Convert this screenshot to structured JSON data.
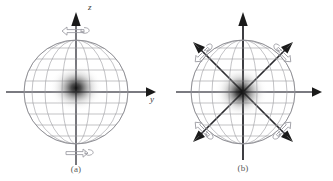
{
  "figure": {
    "background_color": "#ffffff",
    "width": 333,
    "height": 181
  },
  "colors": {
    "grid": "#9a9aa0",
    "outline": "#8a8a90",
    "axis_gray": "#7a7a80",
    "axis_black": "#1a1a1a",
    "blob": "#1a1a1a",
    "hollow_arrow_stroke": "#9a9aa0",
    "caption_text": "#5a5a5a",
    "label_text": "#3c3c3c"
  },
  "panels": [
    {
      "id": "a",
      "caption": "(a)",
      "center": {
        "x": 76,
        "y": 92
      },
      "radius": 52,
      "sphere": {
        "latitude_count": 9,
        "longitude_count": 7,
        "blob": {
          "cx": 76,
          "cy": 88,
          "rx": 27,
          "ry": 24,
          "label": "probability-density-blob"
        }
      },
      "axes": [
        {
          "name": "z-axis",
          "label": "z",
          "orientation": "vertical",
          "arrow": "solid",
          "color": "#1a1a1a"
        },
        {
          "name": "y-axis",
          "label": "y",
          "orientation": "horizontal",
          "arrow": "solid",
          "color": "#7a7a80"
        }
      ],
      "rotation_arrows": [
        {
          "name": "rotation-arrow-top",
          "position": "top",
          "direction": "right",
          "style": "hollow-curved"
        },
        {
          "name": "rotation-arrow-bottom",
          "position": "bottom",
          "direction": "left",
          "style": "hollow-curved"
        }
      ],
      "spin_arrows": []
    },
    {
      "id": "b",
      "caption": "(b)",
      "center": {
        "x": 243,
        "y": 92
      },
      "radius": 52,
      "sphere": {
        "latitude_count": 9,
        "longitude_count": 7,
        "blob": {
          "cx": 241,
          "cy": 92,
          "rx": 27,
          "ry": 26,
          "label": "probability-density-blob"
        }
      },
      "axes": [
        {
          "name": "z-axis",
          "label": "z",
          "orientation": "vertical",
          "arrow": "solid",
          "color": "#1a1a1a"
        },
        {
          "name": "y-axis",
          "label": "y",
          "orientation": "horizontal",
          "arrow": "solid",
          "color": "#7a7a80"
        }
      ],
      "rotation_arrows": [
        {
          "name": "rotation-arrow-upper-left",
          "position": "upper-left",
          "style": "hollow-curved"
        },
        {
          "name": "rotation-arrow-upper-right",
          "position": "upper-right",
          "style": "hollow-curved"
        },
        {
          "name": "rotation-arrow-lower-left",
          "position": "lower-left",
          "style": "hollow-curved"
        },
        {
          "name": "rotation-arrow-lower-right",
          "position": "lower-right",
          "style": "hollow-curved"
        }
      ],
      "spin_arrows": [
        {
          "name": "spin-arrow-upper-left",
          "angle_deg": 135,
          "arrow": "solid"
        },
        {
          "name": "spin-arrow-upper-right",
          "angle_deg": 45,
          "arrow": "solid"
        },
        {
          "name": "spin-arrow-lower-left",
          "angle_deg": 225,
          "arrow": "solid"
        },
        {
          "name": "spin-arrow-lower-right",
          "angle_deg": 315,
          "arrow": "solid"
        }
      ]
    }
  ],
  "labels": {
    "z_a": "z",
    "y_a": "y",
    "z_b": "z",
    "y_b": "y",
    "caption_a": "(a)",
    "caption_b": "(b)"
  }
}
